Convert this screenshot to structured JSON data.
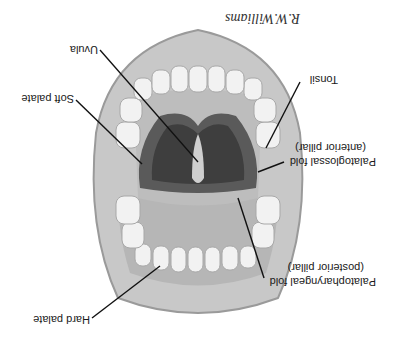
{
  "figure": {
    "orientation": "rotated 180 degrees",
    "signature": "R.W.Williams",
    "labels": [
      {
        "id": "uvula",
        "text": "Uvula"
      },
      {
        "id": "tonsil",
        "text": "Tonsil"
      },
      {
        "id": "soft-palate",
        "text": "Soft palate"
      },
      {
        "id": "palatoglossal",
        "text": "Palatoglossal fold",
        "sub": "(anterior pillar)"
      },
      {
        "id": "palatopharyngeal",
        "text": "Palatopharyngeal fold",
        "sub": "(posterior pillar)"
      },
      {
        "id": "hard-palate",
        "text": "Hard palate"
      }
    ],
    "colors": {
      "background": "#ffffff",
      "lips": "#c8c8c8",
      "lip_edge": "#9a9a9a",
      "teeth": "#f2f2f2",
      "palate": "#bdbdbd",
      "throat": "#5a5a5a",
      "leader_line": "#111111"
    }
  }
}
